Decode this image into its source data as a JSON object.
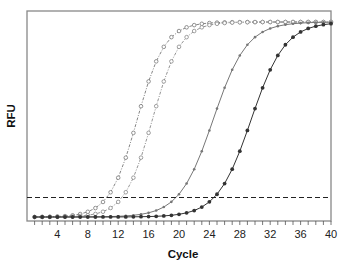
{
  "chart_data": {
    "type": "line",
    "title": "",
    "xlabel": "Cycle",
    "ylabel": "RFU",
    "xlim": [
      0,
      40
    ],
    "ylim": [
      0,
      100
    ],
    "x_ticks": [
      4,
      8,
      12,
      16,
      20,
      24,
      28,
      32,
      36,
      40
    ],
    "minor_x_ticks_every": 1,
    "y_ticks": [],
    "grid": false,
    "legend": null,
    "threshold": {
      "value": 10,
      "style": "dashed",
      "color": "#222222"
    },
    "x": [
      1,
      2,
      3,
      4,
      5,
      6,
      7,
      8,
      9,
      10,
      11,
      12,
      13,
      14,
      15,
      16,
      17,
      18,
      19,
      20,
      21,
      22,
      23,
      24,
      25,
      26,
      27,
      28,
      29,
      30,
      31,
      32,
      33,
      34,
      35,
      36,
      37,
      38,
      39,
      40
    ],
    "series": [
      {
        "name": "Sample A",
        "line": "dash-dot",
        "marker": "open-circle",
        "color": "#777777",
        "midpoint": 14.5,
        "slope": 0.55,
        "ct": 9.5
      },
      {
        "name": "Sample B",
        "line": "dash-dot",
        "marker": "open-circle",
        "color": "#888888",
        "midpoint": 16.5,
        "slope": 0.55,
        "ct": 11.5
      },
      {
        "name": "Sample C",
        "line": "solid",
        "marker": "small-dot",
        "color": "#777777",
        "midpoint": 24.5,
        "slope": 0.45,
        "ct": 19.5
      },
      {
        "name": "Sample D",
        "line": "solid",
        "marker": "filled-circle",
        "color": "#333333",
        "midpoint": 29.5,
        "slope": 0.45,
        "ct": 24.5
      }
    ]
  }
}
